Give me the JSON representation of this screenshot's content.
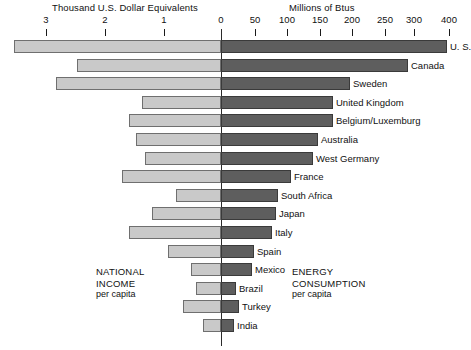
{
  "chart_data": {
    "type": "bar",
    "subtype": "diverging-bidirectional-bar",
    "title": "",
    "left_axis": {
      "label": "Thousand U.S. Dollar Equivalents",
      "ticks": [
        3,
        2,
        1,
        0
      ],
      "tick_labels": [
        "3",
        "2",
        "1",
        "0"
      ],
      "range": [
        3.3,
        0
      ],
      "direction": "right-to-left",
      "series_name": "National income per capita"
    },
    "right_axis": {
      "label": "Millions of Btus",
      "ticks": [
        0,
        50,
        100,
        150,
        200,
        250,
        300,
        400
      ],
      "tick_labels": [
        "0",
        "50",
        "100",
        "150",
        "200",
        "250",
        "300",
        "400"
      ],
      "range": [
        0,
        400
      ],
      "nonlinear_note": "spacing 0-300 is linear, 300-400 compressed",
      "series_name": "Energy consumption per capita"
    },
    "categories": [
      "U. S.",
      "Canada",
      "Sweden",
      "United Kingdom",
      "Belgium/Luxemburg",
      "Australia",
      "West Germany",
      "France",
      "South Africa",
      "Japan",
      "Italy",
      "Spain",
      "Mexico",
      "Brazil",
      "Turkey",
      "India"
    ],
    "series": [
      {
        "name": "National income per capita",
        "unit": "Thousand U.S. Dollar Equivalents",
        "values": [
          3.0,
          2.0,
          1.65,
          1.25,
          1.4,
          1.33,
          1.23,
          1.47,
          0.55,
          0.95,
          1.17,
          0.85,
          0.4,
          0.3,
          0.45,
          0.22
        ]
      },
      {
        "name": "Energy consumption per capita",
        "unit": "Millions of Btus",
        "values": [
          400,
          290,
          195,
          170,
          170,
          147,
          140,
          107,
          87,
          84,
          78,
          55,
          52,
          23,
          27,
          20
        ]
      }
    ],
    "annotations": [
      {
        "id": "left-annotation",
        "line1": "NATIONAL",
        "line2": "INCOME",
        "line3": "per capita"
      },
      {
        "id": "right-annotation",
        "line1": "ENERGY",
        "line2": "CONSUMPTION",
        "line3": "per capita"
      }
    ],
    "colors": {
      "left_bar_fill": "#c9c9c9",
      "left_bar_stroke": "#6f6f6f",
      "right_bar_fill": "#5e5e5e",
      "right_bar_stroke": "#3a3a3a",
      "axis": "#2b2b2b",
      "background": "#ffffff",
      "text": "#111111"
    },
    "grid": false,
    "legend": "none"
  },
  "geometry": {
    "zero_x": 221,
    "row_top": 38,
    "row_pitch": 18.6,
    "left_tick_px": [
      46,
      105,
      164,
      221
    ],
    "right_tick_px": [
      221,
      255,
      287,
      320,
      352,
      385,
      414,
      449
    ],
    "left_bar_start_px": [
      14,
      77,
      56,
      142,
      129,
      136,
      145,
      122,
      176,
      152,
      129,
      168,
      191,
      196,
      183,
      203
    ],
    "right_bar_end_px": [
      447,
      408,
      350,
      333,
      333,
      318,
      313,
      291,
      278,
      276,
      272,
      254,
      252,
      236,
      239,
      234
    ]
  }
}
